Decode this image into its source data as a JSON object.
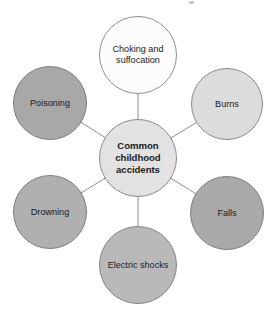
{
  "diagram": {
    "type": "hub-and-spoke",
    "title": "Common childhood accidents",
    "background_color": "#ffffff",
    "spoke_color": "#8f8f8f",
    "center": {
      "label": "Common\nchildhood\naccidents",
      "fill_color": "#e2e2e2",
      "border_color": "#8a8a8a",
      "cx": 138,
      "cy": 158,
      "diameter": 78
    },
    "nodes": [
      {
        "id": "choking-and-suffocation",
        "label": "Choking and\nsuffocation",
        "fill_color": "#fcfcfc",
        "border_color": "#8f8f8f",
        "cx": 138,
        "cy": 55,
        "diameter": 78
      },
      {
        "id": "burns",
        "label": "Burns",
        "fill_color": "#dcdcdc",
        "border_color": "#8a8a8a",
        "cx": 227,
        "cy": 104,
        "diameter": 72
      },
      {
        "id": "falls",
        "label": "Falls",
        "fill_color": "#a9a9a9",
        "border_color": "#7e7e7e",
        "cx": 227,
        "cy": 213,
        "diameter": 74
      },
      {
        "id": "electric-shocks",
        "label": "Electric shocks",
        "fill_color": "#b9b9b9",
        "border_color": "#848484",
        "cx": 138,
        "cy": 265,
        "diameter": 78
      },
      {
        "id": "drowning",
        "label": "Drowning",
        "fill_color": "#b0b0b0",
        "border_color": "#7e7e7e",
        "cx": 50,
        "cy": 212,
        "diameter": 74
      },
      {
        "id": "poisoning",
        "label": "Poisoning",
        "fill_color": "#a8a8a8",
        "border_color": "#7e7e7e",
        "cx": 50,
        "cy": 103,
        "diameter": 74
      }
    ]
  }
}
